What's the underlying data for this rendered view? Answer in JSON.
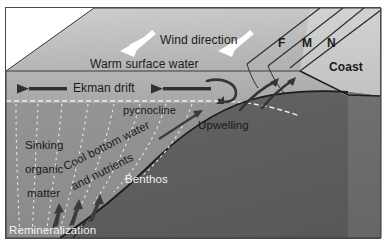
{
  "figure": {
    "type": "oceanographic block diagram"
  },
  "colors": {
    "sea_surface_top": "#b9b9b9",
    "surface_water_front": "#aeaeae",
    "deep_water_front": "#8e8e8e",
    "seafloor_land": "#5e5e5e",
    "coast_top": "#c9c9c9",
    "coast_front": "#6a6a6a",
    "wind_arrow": "#ffffff",
    "ekman_arrow": "#333333",
    "upwelling_arrow": "#3a3a3a",
    "dotted_line": "#e8e8e8",
    "text_dark": "#1a1a1a",
    "text_light": "#f2f2f2",
    "outline": "#222222"
  },
  "labels": {
    "wind_direction": "Wind direction",
    "warm_surface_water": "Warm surface water",
    "ekman_drift": "Ekman drift",
    "pycnocline": "pycnocline",
    "upwelling": "Upwelling",
    "benthos": "Benthos",
    "coast": "Coast",
    "sinking": "Sinking",
    "organic": "organic",
    "matter": "matter",
    "cool_bottom_water": "Cool bottom water",
    "and_nutrients": "and nutrients",
    "remineralization": "Remineralization",
    "zone_f": "F",
    "zone_m": "M",
    "zone_n": "N"
  },
  "arrows": {
    "wind_count": 2,
    "wind_direction_deg": 215,
    "ekman_count": 2,
    "ekman_direction_deg": 180,
    "upwelling_count": 3,
    "sinking_count": 3
  }
}
